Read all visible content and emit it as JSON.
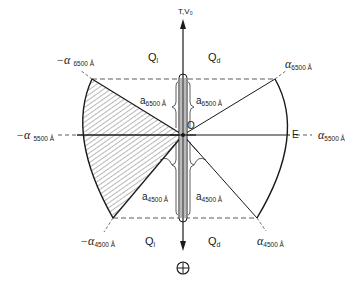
{
  "diagram": {
    "axis_label": "T,V₀",
    "origin_label": "O",
    "e_label": "E",
    "quadrants": {
      "upper_left": {
        "main": "Q",
        "sub": "l"
      },
      "upper_right": {
        "main": "Q",
        "sub": "d"
      },
      "lower_left": {
        "main": "Q",
        "sub": "l"
      },
      "lower_right": {
        "main": "Q",
        "sub": "d"
      }
    },
    "outer_labels": {
      "neg_alpha_6500": {
        "prefix": "−",
        "symbol": "α",
        "sub": "6500 Å"
      },
      "alpha_6500": {
        "prefix": "",
        "symbol": "α",
        "sub": "6500 Å"
      },
      "neg_alpha_5500": {
        "prefix": "−",
        "symbol": "α",
        "sub": "5500 Å"
      },
      "alpha_5500": {
        "prefix": "",
        "symbol": "α",
        "sub": "5500 Å"
      },
      "neg_alpha_4500": {
        "prefix": "−",
        "symbol": "α",
        "sub": "4500 Å"
      },
      "alpha_4500": {
        "prefix": "",
        "symbol": "α",
        "sub": "4500 Å"
      }
    },
    "inner_labels": {
      "a_6500_left": {
        "symbol": "a",
        "sub": "6500 Å"
      },
      "a_6500_right": {
        "symbol": "a",
        "sub": "6500 Å"
      },
      "a_4500_left": {
        "symbol": "a",
        "sub": "4500 Å"
      },
      "a_4500_right": {
        "symbol": "a",
        "sub": "4500 Å"
      }
    },
    "bottom_symbol": "⊕"
  }
}
